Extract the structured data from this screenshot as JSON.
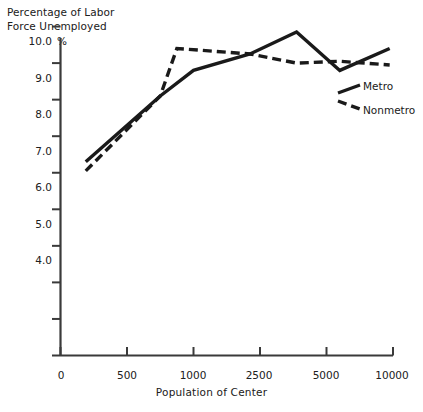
{
  "chart_data": {
    "type": "line",
    "title": "",
    "ylabel": "Percentage of Labor Force Unemployed",
    "ylabel_line1": "Percentage of Labor",
    "ylabel_line2": "Force Unemployed",
    "xlabel": "Population of Center",
    "percent_symbol": "%",
    "categories": [
      "0",
      "500",
      "1000",
      "2500",
      "5000",
      "10000"
    ],
    "x_tick_labels": [
      "0",
      "500",
      "1000",
      "2500",
      "5000",
      "10000"
    ],
    "y_tick_labels": [
      "10.0",
      "9.0",
      "8.0",
      "7.0",
      "6.0",
      "5.0",
      "4.0"
    ],
    "y_tick_values": [
      10.0,
      9.0,
      8.0,
      7.0,
      6.0,
      5.0,
      4.0
    ],
    "y_minor_tick_values": [
      3.0,
      2.0,
      1.0
    ],
    "y_origin_label": "0",
    "ylim": [
      0,
      10.4
    ],
    "xlim": [
      0,
      5.3
    ],
    "grid": false,
    "legend_position": "right",
    "series": [
      {
        "name": "Metro",
        "style": "solid",
        "color": "#1a1a1a",
        "x": [
          0.38,
          1.5,
          2.0,
          2.85,
          3.55,
          4.2,
          4.95
        ],
        "y": [
          5.3,
          7.1,
          7.8,
          8.25,
          8.85,
          7.8,
          8.4
        ]
      },
      {
        "name": "Nonmetro",
        "style": "dashed",
        "color": "#1a1a1a",
        "x": [
          0.38,
          1.5,
          1.75,
          2.85,
          3.55,
          4.2,
          4.95
        ],
        "y": [
          5.05,
          7.1,
          8.4,
          8.25,
          8.0,
          8.05,
          7.95
        ]
      }
    ],
    "legend": [
      {
        "label": "Metro",
        "style": "solid"
      },
      {
        "label": "Nonmetro",
        "style": "dashed"
      }
    ]
  }
}
